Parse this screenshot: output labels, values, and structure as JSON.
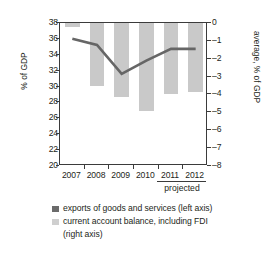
{
  "chart_data": {
    "type": "bar",
    "title": "",
    "subtitle": "",
    "categories": [
      "2007",
      "2008",
      "2009",
      "2010",
      "2011",
      "2012"
    ],
    "xlabel": "",
    "ylabel": "% of GDP",
    "y2label": "average, % of GDP",
    "ylim": [
      20,
      38
    ],
    "y2lim": [
      -8,
      0
    ],
    "yticks": [
      38,
      36,
      34,
      32,
      30,
      28,
      26,
      24,
      22,
      20
    ],
    "y2ticks": [
      "0",
      "–1",
      "–2",
      "–3",
      "–4",
      "–5",
      "–6",
      "–7",
      "–8"
    ],
    "grid": false,
    "legend_position": "below",
    "annotation": "projected",
    "annotation_categories": [
      "2011",
      "2012"
    ],
    "series": [
      {
        "name": "exports of goods and services (left axis)",
        "type": "line",
        "axis": "left",
        "color": "#666666",
        "values": [
          36.0,
          35.2,
          31.5,
          33.2,
          34.7,
          34.7
        ]
      },
      {
        "name": "current account balance, including FDI (right axis)",
        "type": "bar",
        "axis": "right",
        "color": "#c9c9c9",
        "values": [
          -0.2,
          -3.6,
          -4.2,
          -5.0,
          -4.0,
          -3.9
        ]
      }
    ]
  },
  "legend": {
    "items": [
      {
        "label": "exports of goods and services (left axis)",
        "label2": "",
        "color": "#666666"
      },
      {
        "label": "current account balance, including FDI",
        "label2": "(right axis)",
        "color": "#c9c9c9"
      }
    ]
  },
  "colors": {
    "line": "#666666",
    "bar": "#c9c9c9",
    "axis": "#3b3b3b",
    "text": "#231f20",
    "background": "#ffffff"
  }
}
